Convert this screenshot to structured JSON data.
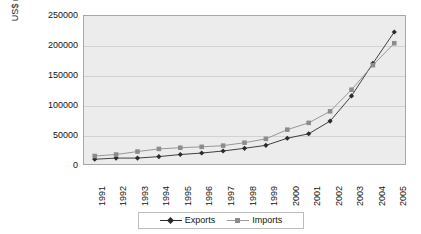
{
  "chart_data": {
    "type": "line",
    "title": "",
    "xlabel": "",
    "ylabel": "US$ million",
    "categories": [
      "1991",
      "1992",
      "1993",
      "1994",
      "1995",
      "1996",
      "1997",
      "1998",
      "1999",
      "2000",
      "2001",
      "2002",
      "2003",
      "2004",
      "2005"
    ],
    "series": [
      {
        "name": "Exports",
        "color": "#2b2b2b",
        "marker": "diamond",
        "values": [
          8000,
          10000,
          10000,
          12500,
          16000,
          18500,
          22000,
          26500,
          31500,
          43500,
          51000,
          72500,
          115000,
          170000,
          223000
        ]
      },
      {
        "name": "Imports",
        "color": "#8c8c8c",
        "marker": "square",
        "values": [
          13500,
          16000,
          21000,
          25500,
          27500,
          29000,
          31000,
          36000,
          42500,
          58000,
          69500,
          89000,
          125500,
          167000,
          204000
        ]
      }
    ],
    "ylim": [
      0,
      250000
    ],
    "yticks": [
      "0",
      "50000",
      "100000",
      "150000",
      "200000",
      "250000"
    ],
    "ytick_values": [
      0,
      50000,
      100000,
      150000,
      200000,
      250000
    ],
    "grid": true,
    "legend_position": "bottom",
    "plot_background": "#ececec",
    "gridline_color": "#d2d2d2",
    "border_color": "#a8a8a8"
  },
  "legend": {
    "items": [
      {
        "label": "Exports",
        "marker_name": "legend-marker-diamond"
      },
      {
        "label": "Imports",
        "marker_name": "legend-marker-square"
      }
    ]
  }
}
